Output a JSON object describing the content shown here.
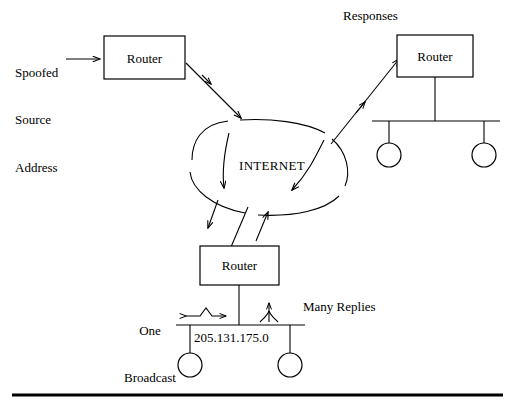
{
  "figure": {
    "background_color": "#ffffff",
    "line_color": "#000000"
  },
  "labels": {
    "spoofed_line1": "Spoofed",
    "spoofed_line2": "Source",
    "spoofed_line3": "Address",
    "responses": "Responses",
    "one_broadcast_line1": "One",
    "one_broadcast_line2": "Broadcast",
    "many_replies": "Many Replies",
    "subnet_address": "205.131.175.0"
  },
  "nodes": {
    "router_attacker": "Router",
    "router_victim": "Router",
    "router_amplifier": "Router",
    "cloud": "INTERNET"
  },
  "hosts": {
    "victim_host_1": "host",
    "victim_host_2": "host",
    "amplifier_host_1": "host",
    "amplifier_host_2": "host"
  },
  "icons": {
    "arrow_into_router": "arrow-right-icon",
    "arrow_router_to_cloud": "arrow-down-right-icon",
    "arrow_cloud_down_left": "arrow-down-icon",
    "arrow_cloud_down_right": "arrow-down-left-icon",
    "arrow_cloud_to_amplifier": "arrow-down-icon",
    "arrow_amplifier_to_cloud": "arrow-up-icon",
    "arrow_cloud_to_victim": "arrow-up-right-icon",
    "arrow_broadcast": "arrow-bidirectional-icon",
    "arrow_replies": "arrow-up-converging-icon"
  }
}
